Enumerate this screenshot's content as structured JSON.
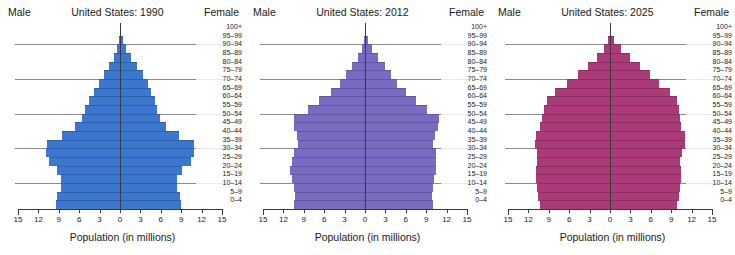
{
  "figure": {
    "male_label": "Male",
    "female_label": "Female",
    "x_axis_title": "Population (in millions)",
    "age_groups": [
      "100+",
      "95–99",
      "90–94",
      "85–89",
      "80–84",
      "75–79",
      "70–74",
      "65–69",
      "60–64",
      "55–59",
      "50–54",
      "45–49",
      "40–44",
      "35–39",
      "30–34",
      "25–29",
      "20–24",
      "15–19",
      "10–14",
      "5–9",
      "0–4"
    ],
    "x_ticks": [
      15,
      12,
      9,
      6,
      3,
      0,
      3,
      6,
      9,
      12,
      15
    ],
    "x_tick_values": [
      -15,
      -12,
      -9,
      -6,
      -3,
      0,
      3,
      6,
      9,
      12,
      15
    ],
    "x_min": -15,
    "x_max": 15,
    "gridline_ages": [
      "95–99",
      "75–79",
      "55–59",
      "35–39",
      "15–19"
    ]
  },
  "chart_data": [
    {
      "type": "bar",
      "title": "United States: 1990",
      "xlabel": "Population (in millions)",
      "ylabel": "",
      "xlim": [
        -15,
        15
      ],
      "grid": true,
      "legend": "none",
      "color": "#3b76cf",
      "categories": [
        "100+",
        "95–99",
        "90–94",
        "85–89",
        "80–84",
        "75–79",
        "70–74",
        "65–69",
        "60–64",
        "55–59",
        "50–54",
        "45–49",
        "40–44",
        "35–39",
        "30–34",
        "25–29",
        "20–24",
        "15–19",
        "10–14",
        "5–9",
        "0–4"
      ],
      "series": [
        {
          "name": "Male",
          "values": [
            0.02,
            0.15,
            0.45,
            0.85,
            1.55,
            2.3,
            3.15,
            3.85,
            4.6,
            5.1,
            5.55,
            6.55,
            8.5,
            10.7,
            10.9,
            10.4,
            9.2,
            8.7,
            8.75,
            9.2,
            9.4
          ]
        },
        {
          "name": "Female",
          "values": [
            0.07,
            0.38,
            0.95,
            1.6,
            2.55,
            3.35,
            4.1,
            4.6,
            5.1,
            5.5,
            5.85,
            6.8,
            8.7,
            10.85,
            10.95,
            10.4,
            9.1,
            8.35,
            8.35,
            8.75,
            8.95
          ]
        }
      ]
    },
    {
      "type": "bar",
      "title": "United States: 2012",
      "xlabel": "Population (in millions)",
      "ylabel": "",
      "xlim": [
        -15,
        15
      ],
      "grid": true,
      "legend": "none",
      "color": "#7a6bc2",
      "categories": [
        "100+",
        "95–99",
        "90–94",
        "85–89",
        "80–84",
        "75–79",
        "70–74",
        "65–69",
        "60–64",
        "55–59",
        "50–54",
        "45–49",
        "40–44",
        "35–39",
        "30–34",
        "25–29",
        "20–24",
        "15–19",
        "10–14",
        "5–9",
        "0–4"
      ],
      "series": [
        {
          "name": "Male",
          "values": [
            0.02,
            0.14,
            0.5,
            1.05,
            1.9,
            2.75,
            3.75,
            5.05,
            6.75,
            8.4,
            10.4,
            10.4,
            10.0,
            9.9,
            10.45,
            10.75,
            11.0,
            10.7,
            10.4,
            10.3,
            10.4
          ]
        },
        {
          "name": "Female",
          "values": [
            0.06,
            0.38,
            1.05,
            1.85,
            2.95,
            3.85,
            4.75,
            6.0,
            7.55,
            9.1,
            10.95,
            10.8,
            10.25,
            10.05,
            10.4,
            10.45,
            10.5,
            10.2,
            9.95,
            9.85,
            9.95
          ]
        }
      ]
    },
    {
      "type": "bar",
      "title": "United States: 2025",
      "xlabel": "Population (in millions)",
      "ylabel": "",
      "xlim": [
        -15,
        15
      ],
      "grid": true,
      "legend": "none",
      "color": "#ab3b78",
      "categories": [
        "100+",
        "95–99",
        "90–94",
        "85–89",
        "80–84",
        "75–79",
        "70–74",
        "65–69",
        "60–64",
        "55–59",
        "50–54",
        "45–49",
        "40–44",
        "35–39",
        "30–34",
        "25–29",
        "20–24",
        "15–19",
        "10–14",
        "5–9",
        "0–4"
      ],
      "series": [
        {
          "name": "Male",
          "values": [
            0.05,
            0.28,
            0.85,
            1.85,
            3.25,
            4.75,
            6.35,
            8.05,
            9.3,
            9.75,
            9.95,
            10.3,
            10.95,
            11.1,
            10.75,
            10.7,
            10.95,
            10.95,
            10.8,
            10.55,
            10.3
          ]
        },
        {
          "name": "Female",
          "values": [
            0.14,
            0.65,
            1.6,
            2.9,
            4.4,
            5.85,
            7.25,
            8.75,
            9.85,
            10.2,
            10.3,
            10.5,
            11.05,
            11.1,
            10.6,
            10.35,
            10.5,
            10.45,
            10.35,
            10.1,
            9.85
          ]
        }
      ]
    }
  ]
}
